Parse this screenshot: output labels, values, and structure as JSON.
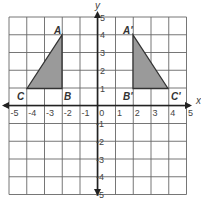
{
  "diagram": {
    "type": "coordinate-plane-reflection",
    "axes": {
      "x_label": "x",
      "y_label": "y",
      "range": [
        -5,
        5
      ]
    },
    "x_ticks": [
      "-5",
      "-4",
      "-3",
      "-2",
      "-1",
      "0",
      "1",
      "2",
      "3",
      "4",
      "5"
    ],
    "y_ticks_pos": [
      "1",
      "2",
      "3",
      "4",
      "5"
    ],
    "y_ticks_neg": [
      "-1",
      "-2",
      "-3",
      "-4",
      "-5"
    ],
    "triangle_original": {
      "labels": {
        "A": "A",
        "B": "B",
        "C": "C"
      },
      "vertices": {
        "A": [
          -2,
          4
        ],
        "B": [
          -2,
          1
        ],
        "C": [
          -4,
          1
        ]
      }
    },
    "triangle_image": {
      "labels": {
        "A": "A'",
        "B": "B'",
        "C": "C'"
      },
      "vertices": {
        "A": [
          2,
          4
        ],
        "B": [
          2,
          1
        ],
        "C": [
          4,
          1
        ]
      }
    },
    "colors": {
      "fill": "#9a9a9a",
      "grid": "#555555",
      "axis": "#222222"
    }
  }
}
